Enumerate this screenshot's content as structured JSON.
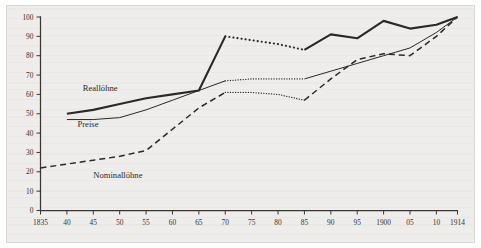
{
  "figure": {
    "background_color": "#eeedeb",
    "ink_color": "#2b2826",
    "plate_border_color": "#d8d6d2"
  },
  "chart_data": {
    "type": "line",
    "title": "",
    "subtitle": "",
    "xlabel": "",
    "ylabel": "",
    "xlim": [
      1835,
      1914
    ],
    "ylim": [
      0,
      100
    ],
    "grid": false,
    "legend": "inline-annotations",
    "x_tick_labels": [
      "1835",
      "40",
      "45",
      "50",
      "55",
      "60",
      "65",
      "70",
      "75",
      "80",
      "85",
      "90",
      "95",
      "1900",
      "05",
      "10",
      "1914"
    ],
    "x_tick_values": [
      1835,
      1840,
      1845,
      1850,
      1855,
      1860,
      1865,
      1870,
      1875,
      1880,
      1885,
      1890,
      1895,
      1900,
      1905,
      1910,
      1914
    ],
    "y_tick_labels": [
      "0",
      "10",
      "20",
      "30",
      "40",
      "50",
      "60",
      "70",
      "80",
      "90",
      "100"
    ],
    "y_tick_values": [
      0,
      10,
      20,
      30,
      40,
      50,
      60,
      70,
      80,
      90,
      100
    ],
    "series": [
      {
        "name": "Reallöhne",
        "style": "solid-thick",
        "width": 2.1,
        "x": [
          1840,
          1845,
          1850,
          1855,
          1860,
          1865,
          1870
        ],
        "values": [
          50,
          52,
          55,
          58,
          60,
          62,
          90
        ],
        "gap_style": "dotted",
        "gap_width": 2.1,
        "gap_x": [
          1870,
          1875,
          1880,
          1885
        ],
        "gap_values": [
          90,
          88,
          86,
          83
        ],
        "tail_style": "solid-thick",
        "tail_width": 2.1,
        "tail_x": [
          1885,
          1890,
          1895,
          1900,
          1905,
          1910,
          1914
        ],
        "tail_values": [
          83,
          91,
          89,
          98,
          94,
          96,
          100
        ]
      },
      {
        "name": "Preise",
        "style": "solid-thin",
        "width": 1.0,
        "x": [
          1840,
          1845,
          1850,
          1855,
          1860,
          1865,
          1870
        ],
        "values": [
          47,
          47,
          48,
          52,
          57,
          62,
          67
        ],
        "gap_style": "dotted",
        "gap_width": 1.3,
        "gap_x": [
          1870,
          1875,
          1880,
          1885
        ],
        "gap_values": [
          67,
          68,
          68,
          68
        ],
        "tail_style": "solid-thin",
        "tail_width": 1.0,
        "tail_x": [
          1885,
          1890,
          1895,
          1900,
          1905,
          1910,
          1914
        ],
        "tail_values": [
          68,
          72,
          76,
          80,
          84,
          92,
          100
        ]
      },
      {
        "name": "Nominallöhne",
        "style": "dashed",
        "width": 1.5,
        "x": [
          1835,
          1840,
          1845,
          1850,
          1855,
          1860,
          1865,
          1870
        ],
        "values": [
          22,
          24,
          26,
          28,
          31,
          42,
          53,
          61
        ],
        "gap_style": "dotted",
        "gap_width": 1.3,
        "gap_x": [
          1870,
          1875,
          1880,
          1885
        ],
        "gap_values": [
          61,
          61,
          60,
          57
        ],
        "tail_style": "dashed",
        "tail_width": 1.5,
        "tail_x": [
          1885,
          1890,
          1895,
          1900,
          1905,
          1910,
          1914
        ],
        "tail_values": [
          57,
          68,
          78,
          81,
          80,
          90,
          100
        ]
      }
    ],
    "annotations": [
      {
        "text": "Reallöhne",
        "x": 1843,
        "y": 62,
        "anchor": "start"
      },
      {
        "text": "Preise",
        "x": 1842,
        "y": 43,
        "anchor": "start"
      },
      {
        "text": "Nominallöhne",
        "x": 1845,
        "y": 17,
        "anchor": "start"
      }
    ]
  }
}
